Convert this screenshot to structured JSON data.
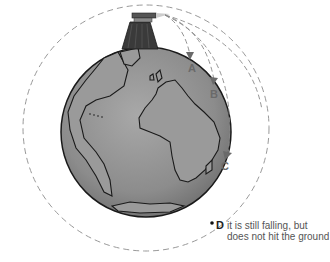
{
  "diagram": {
    "labels": {
      "a": "A",
      "b": "B",
      "c": "C",
      "d": "D"
    },
    "caption_line1": "it is still falling, but",
    "caption_line2": "does not hit the ground",
    "colors": {
      "earth": "#8a8a8a",
      "outline": "#1a1a1a",
      "trajectory": "#888888",
      "arrow": "#6a6a6a"
    }
  }
}
